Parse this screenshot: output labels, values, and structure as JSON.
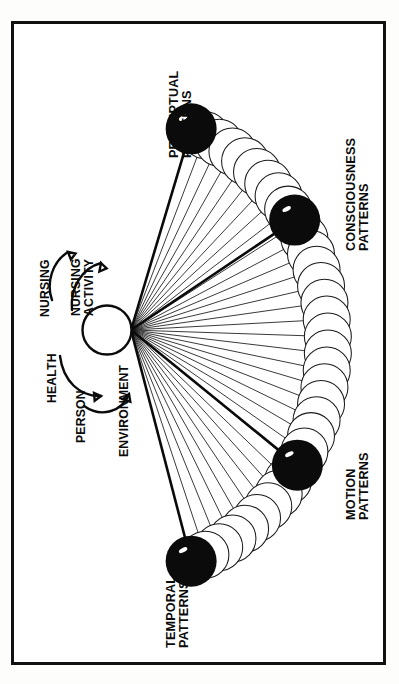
{
  "figure": {
    "type": "conceptual-diagram",
    "orientation": "rotated-90-ccw",
    "frame": {
      "border_color": "#111111",
      "background": "#ffffff"
    },
    "ink_color": "#0b0b0b"
  },
  "center": {
    "node_name": "central-node",
    "node_fill": "#ffffff",
    "labels": [
      {
        "id": "nursing",
        "text": "NURSING"
      },
      {
        "id": "nursing-activity",
        "text_line1": "NURSING",
        "text_line2": "ACTIVITY"
      },
      {
        "id": "health",
        "text": "HEALTH"
      },
      {
        "id": "person",
        "text": "PERSON"
      },
      {
        "id": "environment",
        "text": "ENVIRONMENT"
      }
    ]
  },
  "pattern_nodes": [
    {
      "id": "perceptual",
      "line1": "PERCEPTUAL",
      "line2": "PATTERNS",
      "color": "#0b0b0b"
    },
    {
      "id": "consciousness",
      "line1": "CONSCIOUSNESS",
      "line2": "PATTERNS",
      "color": "#0b0b0b"
    },
    {
      "id": "motion",
      "line1": "MOTION",
      "line2": "PATTERNS",
      "color": "#0b0b0b"
    },
    {
      "id": "temporal",
      "line1": "TEMPORAL",
      "line2": "PATTERNS",
      "color": "#0b0b0b"
    }
  ],
  "arc": {
    "description": "chain of overlapping open circles forming an arc",
    "circle_count": 34,
    "fill": "#ffffff",
    "stroke": "#1a1a1a"
  },
  "rays": {
    "description": "fan of straight lines radiating from the central node to the arc",
    "count": 34,
    "emphasized_count": 4
  }
}
